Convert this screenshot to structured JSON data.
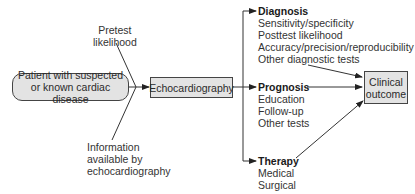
{
  "diagram": {
    "nodes": {
      "patient": {
        "line1": "Patient with suspected",
        "line2": "or known cardiac disease"
      },
      "echo": {
        "label": "Echocardiography"
      },
      "outcome": {
        "line1": "Clinical",
        "line2": "outcome"
      }
    },
    "inputs": {
      "pretest": {
        "line1": "Pretest",
        "line2": "likelihood"
      },
      "information": {
        "line1": "Information",
        "line2": "available by",
        "line3": "echocardiography"
      }
    },
    "branches": {
      "diagnosis": {
        "title": "Diagnosis",
        "items": [
          "Sensitivity/specificity",
          "Posttest likelihood",
          "Accuracy/precision/reproducibility",
          "Other diagnostic tests"
        ]
      },
      "prognosis": {
        "title": "Prognosis",
        "items": [
          "Education",
          "Follow-up",
          "Other tests"
        ]
      },
      "therapy": {
        "title": "Therapy",
        "items": [
          "Medical",
          "Surgical"
        ]
      }
    },
    "colors": {
      "box_fill": "#e3e3e3",
      "stroke": "#333333"
    }
  }
}
